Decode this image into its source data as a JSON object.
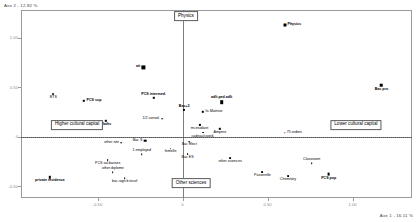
{
  "figure": {
    "type": "mca-scatter",
    "background": "#ffffff",
    "frame_color": "#9a9a9a"
  },
  "chart_data": {
    "type": "scatter",
    "title": "",
    "subtitle": "",
    "xlabel": "Axe 1 - 16.11 %",
    "ylabel": "Axe 2 - 12.82 %",
    "xlim": [
      -0.95,
      1.35
    ],
    "ylim": [
      -0.62,
      1.28
    ],
    "xticks": [
      -0.5,
      0.0,
      0.5,
      1.0
    ],
    "xticklabels": [
      "-0.50",
      "0",
      "0.50",
      "1.00"
    ],
    "yticks": [
      -0.5,
      0.0,
      0.5,
      1.0
    ],
    "yticklabels": [
      "-0.50",
      "0",
      "0.50",
      "1.00"
    ],
    "grid": false,
    "legend": "none",
    "reference_lines": {
      "vertical_axis_x": 0.0,
      "horizontal_axis_y": 0.0,
      "dotted_rule_y": 0.0
    },
    "annotations": [
      {
        "text": "Physics",
        "x": 0.02,
        "y": 1.22,
        "style": "box"
      },
      {
        "text": "Other sciences",
        "x": 0.05,
        "y": -0.47,
        "style": "box"
      },
      {
        "text": "Higher cultural capital",
        "x": -0.62,
        "y": 0.12,
        "style": "box"
      },
      {
        "text": "Lower cultural capital",
        "x": 1.02,
        "y": 0.12,
        "style": "box"
      }
    ],
    "points": [
      {
        "label": "Physics",
        "x": 0.6,
        "y": 1.13,
        "marker": "square",
        "size": 3.0,
        "label_pos": "right"
      },
      {
        "label": "Bac pro",
        "x": 1.17,
        "y": 0.52,
        "marker": "square",
        "size": 2.6,
        "label_pos": "below"
      },
      {
        "label": "BTS",
        "x": -0.76,
        "y": 0.43,
        "marker": "dot",
        "size": 2.0,
        "label_pos": "below"
      },
      {
        "label": "ait",
        "x": -0.23,
        "y": 0.7,
        "marker": "square",
        "size": 3.2,
        "label_pos": "left"
      },
      {
        "label": "PCS sup",
        "x": -0.58,
        "y": 0.36,
        "marker": "square",
        "size": 2.4,
        "label_pos": "right"
      },
      {
        "label": "PCS intermed.",
        "x": -0.17,
        "y": 0.39,
        "marker": "square",
        "size": 2.4,
        "label_pos": "above"
      },
      {
        "label": "adlt.ped.adlt",
        "x": 0.23,
        "y": 0.35,
        "marker": "square",
        "size": 3.6,
        "label_pos": "above"
      },
      {
        "label": "Bac+3",
        "x": 0.01,
        "y": 0.27,
        "marker": "square",
        "size": 2.2,
        "label_pos": "above"
      },
      {
        "label": "lic.Maitrise",
        "x": 0.12,
        "y": 0.25,
        "marker": "square-open",
        "size": 2.4,
        "label_pos": "right"
      },
      {
        "label": "Maths",
        "x": -0.45,
        "y": 0.16,
        "marker": "square",
        "size": 2.4,
        "label_pos": "below"
      },
      {
        "label": "1/2 consol.",
        "x": -0.12,
        "y": 0.18,
        "marker": "dot",
        "size": 1.6,
        "label_pos": "left"
      },
      {
        "label": "mi.etudiant",
        "x": 0.1,
        "y": 0.12,
        "marker": "square-open",
        "size": 2.2,
        "label_pos": "below"
      },
      {
        "label": "cadeau/coord.",
        "x": 0.12,
        "y": 0.04,
        "marker": "dot",
        "size": 1.8,
        "label_pos": "below"
      },
      {
        "label": "Ampere",
        "x": 0.22,
        "y": 0.08,
        "marker": "square-open",
        "size": 2.4,
        "label_pos": "below"
      },
      {
        "label": "75 ordres",
        "x": 0.6,
        "y": 0.04,
        "marker": "dot",
        "size": 1.4,
        "label_pos": "right"
      },
      {
        "label": "other site",
        "x": -0.36,
        "y": -0.06,
        "marker": "dot",
        "size": 1.6,
        "label_pos": "left"
      },
      {
        "label": "Bac S",
        "x": -0.22,
        "y": -0.04,
        "marker": "square-open",
        "size": 2.6,
        "label_pos": "left"
      },
      {
        "label": "Bac Elect",
        "x": 0.04,
        "y": -0.05,
        "marker": "dot",
        "size": 1.6,
        "label_pos": "below"
      },
      {
        "label": "femelle",
        "x": -0.07,
        "y": -0.12,
        "marker": "dot",
        "size": 1.6,
        "label_pos": "below"
      },
      {
        "label": "Bac ES",
        "x": 0.03,
        "y": -0.18,
        "marker": "dot",
        "size": 1.8,
        "label_pos": "below"
      },
      {
        "label": "other sciences",
        "x": 0.28,
        "y": -0.22,
        "marker": "dot",
        "size": 1.8,
        "label_pos": "below"
      },
      {
        "label": "1 employed",
        "x": -0.24,
        "y": -0.18,
        "marker": "dot",
        "size": 1.6,
        "label_pos": "above"
      },
      {
        "label": "PCS sal.basses",
        "x": -0.44,
        "y": -0.24,
        "marker": "dot",
        "size": 1.8,
        "label_pos": "below"
      },
      {
        "label": "other diplome",
        "x": -0.41,
        "y": -0.36,
        "marker": "dot",
        "size": 1.6,
        "label_pos": "above"
      },
      {
        "label": "bac.sign.b.tecof",
        "x": -0.34,
        "y": -0.42,
        "marker": "dot",
        "size": 1.6,
        "label_pos": "below"
      },
      {
        "label": "private residence",
        "x": -0.78,
        "y": -0.41,
        "marker": "square",
        "size": 2.4,
        "label_pos": "below"
      },
      {
        "label": "Chemistry",
        "x": 0.62,
        "y": -0.4,
        "marker": "dot",
        "size": 1.8,
        "label_pos": "below"
      },
      {
        "label": "Passerelle",
        "x": 0.47,
        "y": -0.36,
        "marker": "dot",
        "size": 1.8,
        "label_pos": "below"
      },
      {
        "label": "Classroom",
        "x": 0.76,
        "y": -0.27,
        "marker": "dot",
        "size": 1.6,
        "label_pos": "above"
      },
      {
        "label": "PCS pop",
        "x": 0.86,
        "y": -0.38,
        "marker": "square",
        "size": 2.8,
        "label_pos": "below"
      }
    ]
  }
}
